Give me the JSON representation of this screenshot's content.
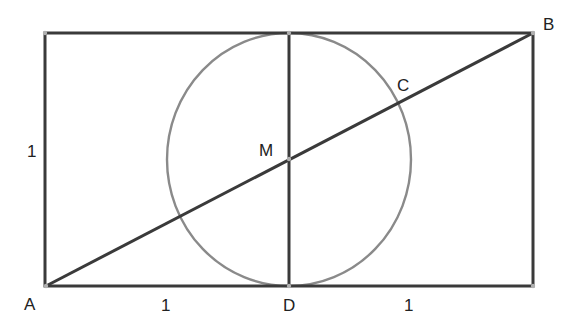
{
  "diagram": {
    "type": "geometry",
    "colors": {
      "stroke": "#3a3a3a",
      "circle": "#8a8a8a",
      "point": "#b0b0b0",
      "text": "#222222"
    },
    "points": {
      "A": {
        "label": "A",
        "x": 46,
        "y": 286
      },
      "B": {
        "label": "B",
        "x": 533,
        "y": 33
      },
      "C": {
        "label": "C",
        "x": 400,
        "y": 102
      },
      "D": {
        "label": "D",
        "x": 289,
        "y": 286
      },
      "M": {
        "label": "M",
        "x": 289,
        "y": 159
      }
    },
    "labels": {
      "A": "A",
      "B": "B",
      "C": "C",
      "D": "D",
      "M": "M",
      "side_left": "1",
      "bottom_left": "1",
      "bottom_right": "1"
    }
  }
}
